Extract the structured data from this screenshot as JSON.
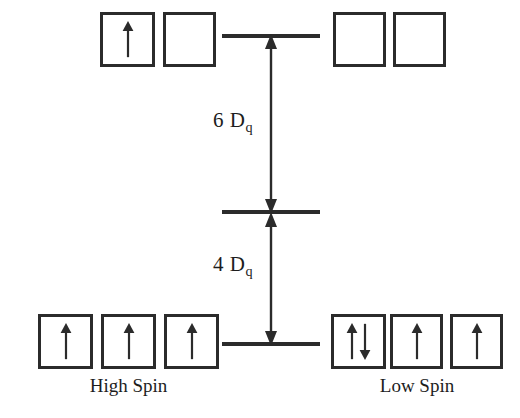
{
  "diagram": {
    "colors": {
      "stroke": "#2b2b2b",
      "text": "#1d1d1d",
      "background": "#ffffff"
    },
    "levels": {
      "upper": {
        "name": "eg",
        "line_y": 36
      },
      "barycenter": {
        "name": "barycenter",
        "line_y": 212
      },
      "lower": {
        "name": "t2g",
        "line_y": 344
      }
    },
    "splitting": [
      {
        "id": "upper-split",
        "value": "6",
        "symbol": "D",
        "subscript": "q",
        "label": "6 Dq",
        "from_level": "barycenter",
        "to_level": "upper"
      },
      {
        "id": "lower-split",
        "value": "4",
        "symbol": "D",
        "subscript": "q",
        "label": "4 Dq",
        "from_level": "lower",
        "to_level": "barycenter"
      }
    ],
    "configurations": [
      {
        "id": "high-spin",
        "label": "High Spin",
        "side": "left",
        "upper_boxes": [
          {
            "index": 0,
            "electrons": [
              "up"
            ]
          },
          {
            "index": 1,
            "electrons": []
          }
        ],
        "lower_boxes": [
          {
            "index": 0,
            "electrons": [
              "up"
            ]
          },
          {
            "index": 1,
            "electrons": [
              "up"
            ]
          },
          {
            "index": 2,
            "electrons": [
              "up"
            ]
          }
        ],
        "unpaired_electrons": 5,
        "total_electrons": 5
      },
      {
        "id": "low-spin",
        "label": "Low Spin",
        "side": "right",
        "upper_boxes": [
          {
            "index": 0,
            "electrons": []
          },
          {
            "index": 1,
            "electrons": []
          }
        ],
        "lower_boxes": [
          {
            "index": 0,
            "electrons": [
              "up",
              "down"
            ]
          },
          {
            "index": 1,
            "electrons": [
              "up"
            ]
          },
          {
            "index": 2,
            "electrons": [
              "up"
            ]
          }
        ],
        "unpaired_electrons": 1,
        "total_electrons": 5
      }
    ]
  }
}
